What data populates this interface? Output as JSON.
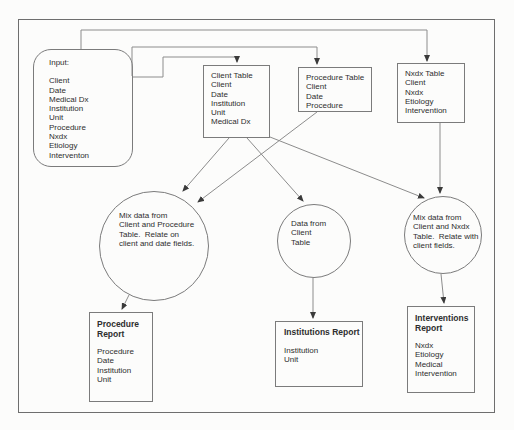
{
  "diagram": {
    "input": {
      "title": "Input:",
      "items": [
        "Client",
        "Date",
        "Medical Dx",
        "Institution",
        "Unit",
        "Procedure",
        "Nxdx",
        "Etiology",
        "Interventon"
      ]
    },
    "tables": {
      "client": {
        "lines": [
          "Client Table",
          "Client",
          "Date",
          "Institution",
          "Unit",
          "Medical Dx"
        ]
      },
      "procedure": {
        "lines": [
          "Procedure Table",
          "Client",
          "Date",
          "Procedure"
        ]
      },
      "nxdx": {
        "lines": [
          "Nxdx Table",
          "Client",
          "Nxdx",
          "Etiology",
          "Intervention"
        ]
      }
    },
    "processes": {
      "mix_client_procedure": {
        "lines": [
          "Mix data from",
          "Client and Procedure",
          "Table.  Relate on",
          "client and date fields."
        ]
      },
      "data_from_client": {
        "lines": [
          "Data from",
          "Client",
          "Table"
        ]
      },
      "mix_client_nxdx": {
        "lines": [
          "Mix data from",
          "Client and Nxdx",
          "Table.  Relate with",
          "client fields."
        ]
      }
    },
    "reports": {
      "procedure": {
        "title": "Procedure Report",
        "items": [
          "Procedure",
          "Date",
          "Institution",
          "Unit"
        ]
      },
      "institutions": {
        "title": "Institutions Report",
        "items": [
          "Institution",
          "Unit"
        ]
      },
      "interventions": {
        "title": "Interventions Report",
        "items": [
          "Nxdx",
          "Etiology",
          "Medical",
          "Intervention"
        ]
      }
    },
    "colors": {
      "line": "#8c8c8c",
      "border": "#7b7b7b",
      "arrowhead": "#3a3a3a",
      "text": "#2e2e2e",
      "background": "#fcfcfb"
    }
  }
}
